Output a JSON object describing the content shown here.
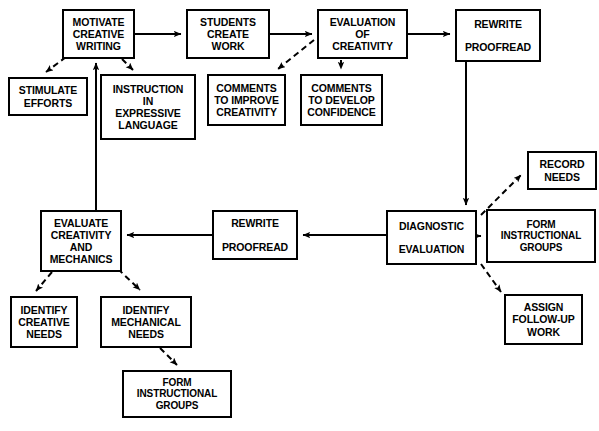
{
  "diagram": {
    "type": "flowchart",
    "width": 599,
    "height": 431,
    "background_color": "#ffffff",
    "line_color": "#000000",
    "text_color": "#000000",
    "nodes": [
      {
        "id": "motivate",
        "lines": [
          "MOTIVATE",
          "CREATIVE",
          "WRITING"
        ],
        "x": 62,
        "y": 9,
        "w": 73,
        "h": 50,
        "spaced": false
      },
      {
        "id": "stimulate",
        "lines": [
          "STIMULATE",
          "EFFORTS"
        ],
        "x": 8,
        "y": 77,
        "w": 80,
        "h": 39,
        "spaced": false
      },
      {
        "id": "instruction",
        "lines": [
          "INSTRUCTION",
          "IN",
          "EXPRESSIVE",
          "LANGUAGE"
        ],
        "x": 100,
        "y": 74,
        "w": 96,
        "h": 66,
        "spaced": false
      },
      {
        "id": "students",
        "lines": [
          "STUDENTS",
          "CREATE",
          "WORK"
        ],
        "x": 186,
        "y": 9,
        "w": 84,
        "h": 50,
        "spaced": false
      },
      {
        "id": "comments_improve",
        "lines": [
          "COMMENTS",
          "TO IMPROVE",
          "CREATIVITY"
        ],
        "x": 207,
        "y": 74,
        "w": 79,
        "h": 52,
        "spaced": false
      },
      {
        "id": "evaluation",
        "lines": [
          "EVALUATION",
          "OF",
          "CREATIVITY"
        ],
        "x": 317,
        "y": 9,
        "w": 91,
        "h": 50,
        "spaced": false
      },
      {
        "id": "comments_develop",
        "lines": [
          "COMMENTS",
          "TO DEVELOP",
          "CONFIDENCE"
        ],
        "x": 300,
        "y": 74,
        "w": 83,
        "h": 52,
        "spaced": false
      },
      {
        "id": "rewrite_top",
        "lines": [
          "REWRITE",
          "PROOFREAD"
        ],
        "x": 455,
        "y": 9,
        "w": 86,
        "h": 53,
        "spaced": true
      },
      {
        "id": "record_needs",
        "lines": [
          "RECORD",
          "NEEDS"
        ],
        "x": 527,
        "y": 151,
        "w": 70,
        "h": 39,
        "spaced": false
      },
      {
        "id": "diagnostic",
        "lines": [
          "DIAGNOSTIC",
          "EVALUATION"
        ],
        "x": 386,
        "y": 210,
        "w": 91,
        "h": 55,
        "spaced": true
      },
      {
        "id": "form_groups_r",
        "lines": [
          "FORM",
          "INSTRUCTIONAL",
          "GROUPS"
        ],
        "x": 486,
        "y": 209,
        "w": 110,
        "h": 54,
        "spaced": false
      },
      {
        "id": "assign_work",
        "lines": [
          "ASSIGN",
          "FOLLOW-UP",
          "WORK"
        ],
        "x": 504,
        "y": 294,
        "w": 79,
        "h": 51,
        "spaced": false
      },
      {
        "id": "rewrite_mid",
        "lines": [
          "REWRITE",
          "PROOFREAD"
        ],
        "x": 212,
        "y": 210,
        "w": 86,
        "h": 50,
        "spaced": true
      },
      {
        "id": "evaluate_cm",
        "lines": [
          "EVALUATE",
          "CREATIVITY",
          "AND",
          "MECHANICS"
        ],
        "x": 40,
        "y": 210,
        "w": 82,
        "h": 62,
        "spaced": false
      },
      {
        "id": "identify_creative",
        "lines": [
          "IDENTIFY",
          "CREATIVE",
          "NEEDS"
        ],
        "x": 10,
        "y": 296,
        "w": 68,
        "h": 52,
        "spaced": false
      },
      {
        "id": "identify_mech",
        "lines": [
          "IDENTIFY",
          "MECHANICAL",
          "NEEDS"
        ],
        "x": 100,
        "y": 296,
        "w": 92,
        "h": 52,
        "spaced": false
      },
      {
        "id": "form_groups_b",
        "lines": [
          "FORM",
          "INSTRUCTIONAL",
          "GROUPS"
        ],
        "x": 122,
        "y": 370,
        "w": 110,
        "h": 48,
        "spaced": false
      }
    ],
    "edges": [
      {
        "from": "motivate",
        "to": "students",
        "style": "solid",
        "arrow": true
      },
      {
        "from": "motivate",
        "to": "stimulate",
        "style": "dashed",
        "arrow": true
      },
      {
        "from": "motivate",
        "to": "instruction",
        "style": "dashed",
        "arrow": true
      },
      {
        "from": "students",
        "to": "evaluation",
        "style": "solid",
        "arrow": true
      },
      {
        "from": "evaluation",
        "to": "comments_improve",
        "style": "dashed",
        "arrow": true
      },
      {
        "from": "evaluation",
        "to": "comments_develop",
        "style": "dashed",
        "arrow": true
      },
      {
        "from": "evaluation",
        "to": "rewrite_top",
        "style": "solid",
        "arrow": true
      },
      {
        "from": "rewrite_top",
        "to": "diagnostic",
        "style": "solid",
        "arrow": true
      },
      {
        "from": "diagnostic",
        "to": "record_needs",
        "style": "dashed",
        "arrow": true
      },
      {
        "from": "diagnostic",
        "to": "form_groups_r",
        "style": "solid",
        "arrow": true
      },
      {
        "from": "diagnostic",
        "to": "assign_work",
        "style": "dashed",
        "arrow": true
      },
      {
        "from": "diagnostic",
        "to": "rewrite_mid",
        "style": "solid",
        "arrow": true
      },
      {
        "from": "rewrite_mid",
        "to": "evaluate_cm",
        "style": "solid",
        "arrow": true
      },
      {
        "from": "evaluate_cm",
        "to": "motivate",
        "style": "solid",
        "arrow": true
      },
      {
        "from": "evaluate_cm",
        "to": "identify_creative",
        "style": "dashed",
        "arrow": true
      },
      {
        "from": "evaluate_cm",
        "to": "identify_mech",
        "style": "dashed",
        "arrow": true
      },
      {
        "from": "identify_mech",
        "to": "form_groups_b",
        "style": "dashed",
        "arrow": true
      }
    ],
    "edge_paths": [
      {
        "id": "motivate-to-students",
        "d": "M135,34 L181,34",
        "style": "solid",
        "arrow_at": [
          181,
          34
        ],
        "arrow_dir": "right"
      },
      {
        "id": "motivate-to-stimulate",
        "d": "M66,57 L46,72",
        "style": "dashed",
        "arrow_at": [
          44,
          74
        ],
        "arrow_dir": "downleft"
      },
      {
        "id": "motivate-to-instruction",
        "d": "M122,59 L133,70",
        "style": "dashed",
        "arrow_at": [
          135,
          72
        ],
        "arrow_dir": "downright"
      },
      {
        "id": "students-to-evaluation",
        "d": "M270,34 L312,34",
        "style": "solid",
        "arrow_at": [
          312,
          34
        ],
        "arrow_dir": "right"
      },
      {
        "id": "evaluation-to-comments-improve",
        "d": "M314,40 L278,69",
        "style": "dashed",
        "arrow_at": [
          276,
          71
        ],
        "arrow_dir": "downleft"
      },
      {
        "id": "evaluation-to-comments-develop",
        "d": "M341,60 L341,69",
        "style": "dashed",
        "arrow_at": [
          341,
          72
        ],
        "arrow_dir": "down"
      },
      {
        "id": "evaluation-to-rewrite-top",
        "d": "M408,34 L450,34",
        "style": "solid",
        "arrow_at": [
          450,
          34
        ],
        "arrow_dir": "right"
      },
      {
        "id": "rewrite-top-to-diagnostic",
        "d": "M466,62 L466,205",
        "style": "solid",
        "arrow_at": [
          466,
          205
        ],
        "arrow_dir": "down"
      },
      {
        "id": "diagnostic-to-record-needs",
        "d": "M481,215 L521,175",
        "style": "dashed",
        "arrow_at": [
          523,
          173
        ],
        "arrow_dir": "upright"
      },
      {
        "id": "diagnostic-to-form-groups",
        "d": "M477,236 L481,236",
        "style": "solid",
        "arrow_at": [
          483,
          236
        ],
        "arrow_dir": "right"
      },
      {
        "id": "diagnostic-to-assign-work",
        "d": "M481,264 L501,292",
        "style": "dashed",
        "arrow_at": [
          503,
          295
        ],
        "arrow_dir": "downright"
      },
      {
        "id": "diagnostic-to-rewrite-mid",
        "d": "M386,235 L303,235",
        "style": "solid",
        "arrow_at": [
          303,
          235
        ],
        "arrow_dir": "left"
      },
      {
        "id": "rewrite-mid-to-evaluate",
        "d": "M212,235 L127,235",
        "style": "solid",
        "arrow_at": [
          127,
          235
        ],
        "arrow_dir": "left"
      },
      {
        "id": "evaluate-to-motivate",
        "d": "M96,210 L96,63",
        "style": "solid",
        "arrow_at": [
          96,
          61
        ],
        "arrow_dir": "up"
      },
      {
        "id": "evaluate-to-identify-creative",
        "d": "M52,272 L36,291",
        "style": "dashed",
        "arrow_at": [
          34,
          293
        ],
        "arrow_dir": "downleft"
      },
      {
        "id": "evaluate-to-identify-mech",
        "d": "M118,269 L140,290",
        "style": "dashed",
        "arrow_at": [
          142,
          292
        ],
        "arrow_dir": "downright"
      },
      {
        "id": "identify-mech-to-form-groups",
        "d": "M160,348 L177,365",
        "style": "dashed",
        "arrow_at": [
          179,
          367
        ],
        "arrow_dir": "downright"
      }
    ]
  }
}
